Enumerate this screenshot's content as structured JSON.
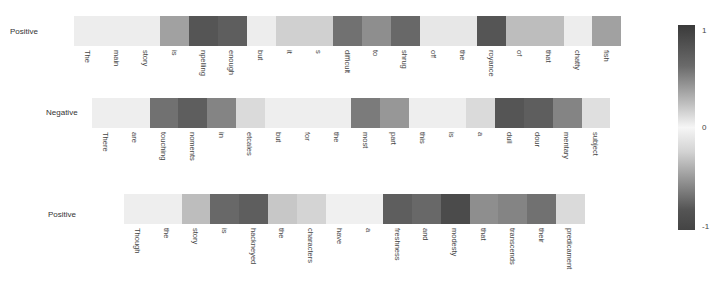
{
  "chart_data": {
    "type": "heatmap",
    "title": "",
    "colorbar": {
      "min": -1,
      "max": 1,
      "ticks": [
        "1",
        "0",
        "-1"
      ]
    },
    "rows": [
      {
        "label": "Positive",
        "tokens": [
          "The",
          "main",
          "story",
          "is",
          "npelling",
          "enough",
          "but",
          "it",
          "s",
          "difficult",
          "to",
          "shrug",
          "off",
          "the",
          "royance",
          "of",
          "that",
          "chatty",
          "fish"
        ],
        "values": [
          0.05,
          0.05,
          0.05,
          0.45,
          0.85,
          0.8,
          0.05,
          0.2,
          0.2,
          0.7,
          0.55,
          0.75,
          0.08,
          0.08,
          0.85,
          0.3,
          0.3,
          0.05,
          0.45
        ]
      },
      {
        "label": "Negative",
        "tokens": [
          "There",
          "are",
          "touching",
          "noments",
          "in",
          "etcales",
          "but",
          "for",
          "the",
          "most",
          "part",
          "this",
          "is",
          "a",
          "dull",
          "dour",
          "mentary",
          "subject"
        ],
        "values": [
          0.04,
          0.04,
          -0.7,
          -0.8,
          -0.6,
          -0.15,
          -0.04,
          -0.04,
          -0.04,
          -0.65,
          -0.5,
          -0.04,
          -0.04,
          -0.15,
          -0.85,
          -0.8,
          -0.6,
          -0.12
        ]
      },
      {
        "label": "Positive",
        "tokens": [
          "Though",
          "the",
          "story",
          "is",
          "hackneyed",
          "the",
          "characters",
          "have",
          "a",
          "freshness",
          "and",
          "modesty",
          "that",
          "transcends",
          "their",
          "predicament"
        ],
        "values": [
          0.04,
          0.04,
          0.3,
          0.75,
          0.8,
          0.25,
          0.18,
          0.03,
          0.03,
          0.8,
          0.75,
          0.9,
          0.55,
          0.6,
          0.7,
          0.15
        ]
      }
    ]
  },
  "layout": {
    "rows": [
      {
        "x": 74,
        "y": 16,
        "label_x": 10,
        "label_y": 27
      },
      {
        "x": 92,
        "y": 98,
        "label_x": 46,
        "label_y": 108
      },
      {
        "x": 124,
        "y": 194,
        "label_x": 48,
        "label_y": 210
      }
    ]
  }
}
